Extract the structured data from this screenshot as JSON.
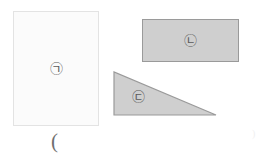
{
  "figure": {
    "background_color": "#ffffff",
    "shapes": [
      {
        "id": "shape-a",
        "kind": "rectangle",
        "label": "㉠",
        "label_reading": "circled-giyeok",
        "fill_color": "#fbfbfb",
        "stroke_color": "#e3e3e3",
        "x": 13,
        "y": 11,
        "width": 86,
        "height": 115
      },
      {
        "id": "shape-b",
        "kind": "rectangle",
        "label": "㉡",
        "label_reading": "circled-nieun",
        "fill_color": "#cfcfcf",
        "stroke_color": "#9a9a9a",
        "x": 142,
        "y": 19,
        "width": 97,
        "height": 43
      },
      {
        "id": "shape-c",
        "kind": "right-triangle",
        "label": "㉢",
        "label_reading": "circled-digeut",
        "fill_color": "#cfcfcf",
        "stroke_color": "#9a9a9a",
        "x": 113,
        "y": 71,
        "width": 104,
        "height": 46,
        "points": "1,1 1,44 103,44"
      }
    ],
    "marks": {
      "bottom_paren": "(",
      "right_edge_marks": ")"
    }
  }
}
